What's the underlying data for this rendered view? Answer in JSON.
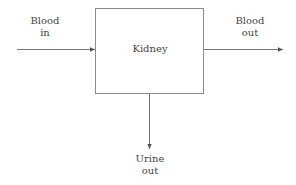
{
  "diagram": {
    "box": {
      "label": "Kidney"
    },
    "inputs": [
      {
        "line1": "Blood",
        "line2": "in"
      }
    ],
    "outputs": [
      {
        "line1": "Blood",
        "line2": "out"
      },
      {
        "line1": "Urine",
        "line2": "out"
      }
    ],
    "colors": {
      "line": "#6b6b6b",
      "box_border": "#8a8a8a",
      "text": "#444444"
    }
  }
}
